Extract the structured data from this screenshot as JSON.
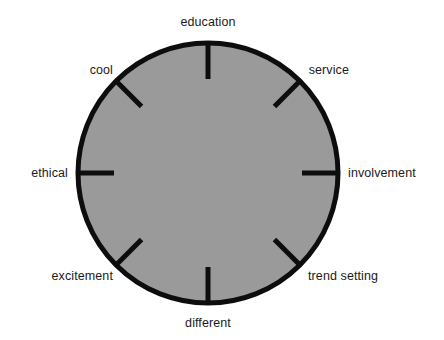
{
  "figure": {
    "kind": "radial-attribute-wheel",
    "background_color": "#ffffff",
    "disc_fill_color": "#9a9a9a",
    "disc_stroke_color": "#0d0d0d",
    "tick_color": "#0d0d0d",
    "label_color": "#1b1b1b"
  },
  "chart_data": {
    "type": "pie",
    "title": "",
    "subtitle": "",
    "xlabel": "",
    "ylabel": "",
    "legend_position": "none",
    "grid": false,
    "center_x": 208,
    "center_y": 173,
    "radius": 130,
    "tick_inner_length": 36,
    "categories": [
      "education",
      "service",
      "involvement",
      "trend setting",
      "different",
      "excitement",
      "ethical",
      "cool"
    ],
    "values": [
      1,
      1,
      1,
      1,
      1,
      1,
      1,
      1
    ],
    "angles_deg": [
      90,
      45,
      0,
      315,
      270,
      225,
      180,
      135
    ],
    "annotations": [
      {
        "text": "education",
        "angle_deg": 90,
        "anchor": "middle",
        "x": 208,
        "y": 22
      },
      {
        "text": "service",
        "angle_deg": 45,
        "anchor": "end",
        "x": 349,
        "y": 70
      },
      {
        "text": "involvement",
        "angle_deg": 0,
        "anchor": "start",
        "x": 348,
        "y": 173
      },
      {
        "text": "trend setting",
        "angle_deg": 315,
        "anchor": "start",
        "x": 308,
        "y": 276
      },
      {
        "text": "different",
        "angle_deg": 270,
        "anchor": "middle",
        "x": 208,
        "y": 323
      },
      {
        "text": "excitement",
        "angle_deg": 225,
        "anchor": "end",
        "x": 113,
        "y": 276
      },
      {
        "text": "ethical",
        "angle_deg": 180,
        "anchor": "end",
        "x": 68,
        "y": 173
      },
      {
        "text": "cool",
        "angle_deg": 135,
        "anchor": "end",
        "x": 113,
        "y": 70
      }
    ]
  },
  "labels": {
    "education": "education",
    "service": "service",
    "involvement": "involvement",
    "trend_setting": "trend setting",
    "different": "different",
    "excitement": "excitement",
    "ethical": "ethical",
    "cool": "cool"
  }
}
